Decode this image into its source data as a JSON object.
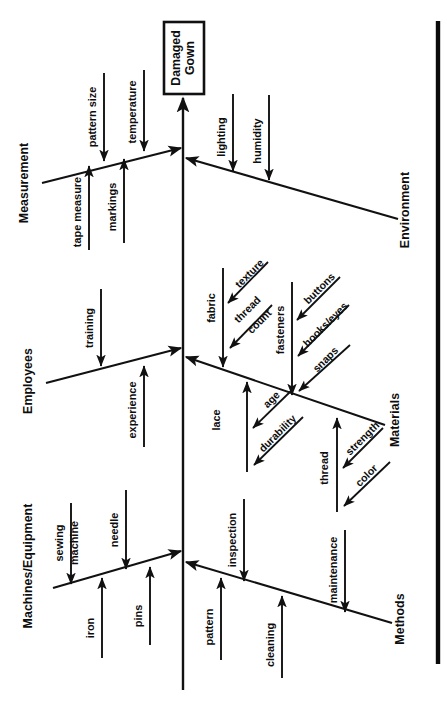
{
  "diagram": {
    "type": "fishbone-ishikawa",
    "orientation": "rotated-90-clockwise",
    "effect": {
      "line1": "Damaged",
      "line2": "Gown",
      "full": "Damaged Gown"
    },
    "colors": {
      "ink": "#111111",
      "paper": "#ffffff"
    },
    "categories": [
      {
        "id": "measurement",
        "label": "Measurement",
        "side": "upper",
        "causes": [
          {
            "label": "pattern size",
            "side": "above"
          },
          {
            "label": "temperature",
            "side": "above"
          },
          {
            "label": "tape measure",
            "side": "below"
          },
          {
            "label": "markings",
            "side": "below"
          }
        ]
      },
      {
        "id": "employees",
        "label": "Employees",
        "side": "upper",
        "causes": [
          {
            "label": "training",
            "side": "above"
          },
          {
            "label": "experience",
            "side": "below"
          }
        ]
      },
      {
        "id": "machines-equipment",
        "label": "Machines/Equipment",
        "side": "upper",
        "causes": [
          {
            "label": "sewing machine",
            "side": "above"
          },
          {
            "label": "needle",
            "side": "above"
          },
          {
            "label": "iron",
            "side": "below"
          },
          {
            "label": "pins",
            "side": "below"
          }
        ]
      },
      {
        "id": "environment",
        "label": "Environment",
        "side": "lower",
        "causes": [
          {
            "label": "lighting",
            "side": "above"
          },
          {
            "label": "humidity",
            "side": "above"
          }
        ]
      },
      {
        "id": "materials",
        "label": "Materials",
        "side": "lower",
        "causes": [
          {
            "label": "fabric",
            "side": "above",
            "subcauses": [
              "texture",
              "thread count"
            ]
          },
          {
            "label": "fasteners",
            "side": "above",
            "subcauses": [
              "buttons",
              "hooks/eyes",
              "snaps"
            ]
          },
          {
            "label": "lace",
            "side": "below",
            "subcauses": [
              "age",
              "durability"
            ]
          },
          {
            "label": "thread",
            "side": "below",
            "subcauses": [
              "strength",
              "color"
            ]
          }
        ]
      },
      {
        "id": "methods",
        "label": "Methods",
        "side": "lower",
        "causes": [
          {
            "label": "inspection",
            "side": "above"
          },
          {
            "label": "maintenance",
            "side": "above"
          },
          {
            "label": "pattern",
            "side": "below"
          },
          {
            "label": "cleaning",
            "side": "below"
          }
        ]
      }
    ]
  },
  "labels": {
    "head_l1": "Damaged",
    "head_l2": "Gown",
    "measurement": "Measurement",
    "employees": "Employees",
    "machines": "Machines/Equipment",
    "environment": "Environment",
    "materials": "Materials",
    "methods": "Methods",
    "pattern_size": "pattern size",
    "temperature": "temperature",
    "tape_measure": "tape measure",
    "markings": "markings",
    "training": "training",
    "experience": "experience",
    "sewing_machine_l1": "sewing",
    "sewing_machine_l2": "machine",
    "needle": "needle",
    "iron": "iron",
    "pins": "pins",
    "lighting": "lighting",
    "humidity": "humidity",
    "fabric": "fabric",
    "texture": "texture",
    "thread_count_l1": "thread",
    "thread_count_l2": "count",
    "fasteners": "fasteners",
    "buttons": "buttons",
    "hooks_eyes": "hooks/eyes",
    "snaps": "snaps",
    "lace": "lace",
    "age": "age",
    "durability": "durability",
    "thread": "thread",
    "strength": "strength",
    "color": "color",
    "inspection": "inspection",
    "maintenance": "maintenance",
    "pattern": "pattern",
    "cleaning": "cleaning"
  }
}
